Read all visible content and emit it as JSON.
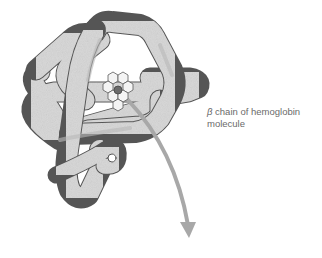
{
  "figure": {
    "label": {
      "symbol": "β",
      "line1_rest": " chain of hemoglobin",
      "line2": "molecule"
    },
    "colors": {
      "background": "#ffffff",
      "chain_fill": "#d9d9d9",
      "chain_shade": "#b9b9b9",
      "chain_outline": "#555555",
      "heme_ring_fill": "#f4f4f4",
      "heme_ring_stroke": "#5a5a5a",
      "iron_center": "#6b6b6b",
      "arrow": "#a8a8a8",
      "label_text": "#6a6a6a"
    },
    "components": [
      "polypeptide-chain",
      "heme-group",
      "iron-atom",
      "pointer-arrow"
    ]
  }
}
